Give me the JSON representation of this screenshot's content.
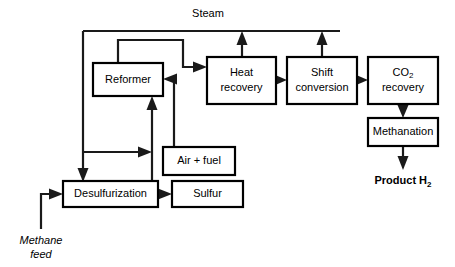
{
  "diagram": {
    "stroke_color": "#1a1a1a",
    "box_fill": "#ffffff",
    "boxes": [
      {
        "id": "reformer",
        "label": "Reformer",
        "label2": "",
        "x": 93,
        "y": 63,
        "w": 70,
        "h": 33
      },
      {
        "id": "heat_recovery",
        "label": "Heat",
        "label2": "recovery",
        "x": 207,
        "y": 57,
        "w": 69,
        "h": 47
      },
      {
        "id": "shift_conversion",
        "label": "Shift",
        "label2": "conversion",
        "x": 287,
        "y": 57,
        "w": 70,
        "h": 47
      },
      {
        "id": "co2_recovery",
        "label": "CO2",
        "label2": "recovery",
        "x": 368,
        "y": 57,
        "w": 70,
        "h": 47
      },
      {
        "id": "methanation",
        "label": "Methanation",
        "label2": "",
        "x": 368,
        "y": 118,
        "w": 70,
        "h": 28
      },
      {
        "id": "air_fuel",
        "label": "Air + fuel",
        "label2": "",
        "x": 163,
        "y": 147,
        "w": 72,
        "h": 28
      },
      {
        "id": "desulfurization",
        "label": "Desulfurization",
        "label2": "",
        "x": 63,
        "y": 181,
        "w": 95,
        "h": 26
      },
      {
        "id": "sulfur",
        "label": "Sulfur",
        "label2": "",
        "x": 172,
        "y": 181,
        "w": 71,
        "h": 26
      }
    ],
    "labels": [
      {
        "id": "steam_label",
        "text": "Steam",
        "x": 208,
        "y": 17,
        "style": "plain"
      },
      {
        "id": "methane_feed_l1",
        "text": "Methane",
        "x": 41,
        "y": 244,
        "style": "italic"
      },
      {
        "id": "methane_feed_l2",
        "text": "feed",
        "x": 41,
        "y": 258,
        "style": "italic"
      },
      {
        "id": "product_h2",
        "text": "Product H",
        "sub": "2",
        "x": 403,
        "y": 184,
        "style": "bold"
      }
    ],
    "co2_label": {
      "main": "CO",
      "sub": "2",
      "second_line": "recovery"
    },
    "flows": [
      {
        "id": "methane-feed-to-desulfurization",
        "from": "Methane feed",
        "to": "Desulfurization"
      },
      {
        "id": "steam-header-to-desulfurization",
        "from": "Steam header",
        "to": "Desulfurization"
      },
      {
        "id": "steam-branch-to-reformer-inlet",
        "from": "Steam header",
        "to": "Reformer inlet"
      },
      {
        "id": "desulfurization-to-sulfur",
        "from": "Desulfurization",
        "to": "Sulfur"
      },
      {
        "id": "desulfurization-to-reformer",
        "from": "Desulfurization",
        "to": "Reformer"
      },
      {
        "id": "air-fuel-to-reformer",
        "from": "Air + fuel",
        "to": "Reformer"
      },
      {
        "id": "reformer-to-heat-recovery",
        "from": "Reformer",
        "to": "Heat recovery"
      },
      {
        "id": "heat-recovery-to-shift-conversion",
        "from": "Heat recovery",
        "to": "Shift conversion"
      },
      {
        "id": "shift-conversion-to-co2-recovery",
        "from": "Shift conversion",
        "to": "CO2 recovery"
      },
      {
        "id": "co2-recovery-to-methanation",
        "from": "CO2 recovery",
        "to": "Methanation"
      },
      {
        "id": "methanation-to-product-h2",
        "from": "Methanation",
        "to": "Product H2"
      },
      {
        "id": "heat-recovery-steam-out",
        "from": "Heat recovery",
        "to": "Steam header"
      },
      {
        "id": "shift-conversion-steam-out",
        "from": "Shift conversion",
        "to": "Steam header"
      }
    ]
  }
}
